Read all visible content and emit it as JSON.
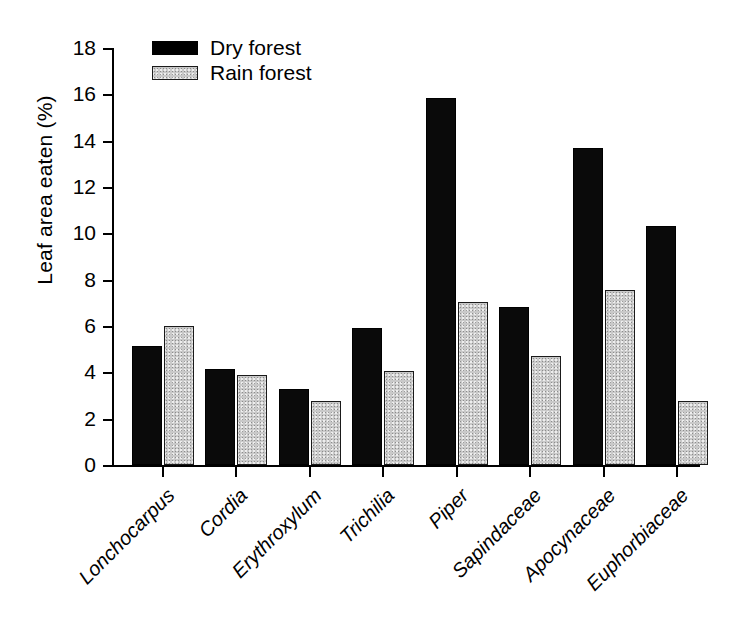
{
  "chart_data": {
    "type": "bar",
    "title": "",
    "subtitle": "",
    "xlabel": "",
    "ylabel": "Leaf area eaten (%)",
    "ylim": [
      0,
      18
    ],
    "ytick_values": [
      0,
      2,
      4,
      6,
      8,
      10,
      12,
      14,
      16,
      18
    ],
    "ytick_labels": [
      "0",
      "2",
      "4",
      "6",
      "8",
      "10",
      "12",
      "14",
      "16",
      "18"
    ],
    "grid": false,
    "legend_position": "top-left",
    "categories": [
      "Lonchocarpus",
      "Cordia",
      "Erythroxylum",
      "Trichilia",
      "Piper",
      "Sapindaceae",
      "Apocynaceae",
      "Euphorbiaceae"
    ],
    "categories_italic": true,
    "series": [
      {
        "name": "Dry forest",
        "color": "#000000",
        "values": [
          5.15,
          4.15,
          3.3,
          5.9,
          15.85,
          6.8,
          13.7,
          10.3
        ]
      },
      {
        "name": "Rain forest",
        "color": "#c9c9c9",
        "values": [
          6.0,
          3.9,
          2.75,
          4.05,
          7.05,
          4.7,
          7.55,
          2.75
        ]
      }
    ]
  },
  "legend": {
    "items": [
      {
        "label": "Dry forest",
        "swatch": "black"
      },
      {
        "label": "Rain forest",
        "swatch": "gray"
      }
    ]
  },
  "axes": {
    "y_label": "Leaf area eaten (%)"
  }
}
